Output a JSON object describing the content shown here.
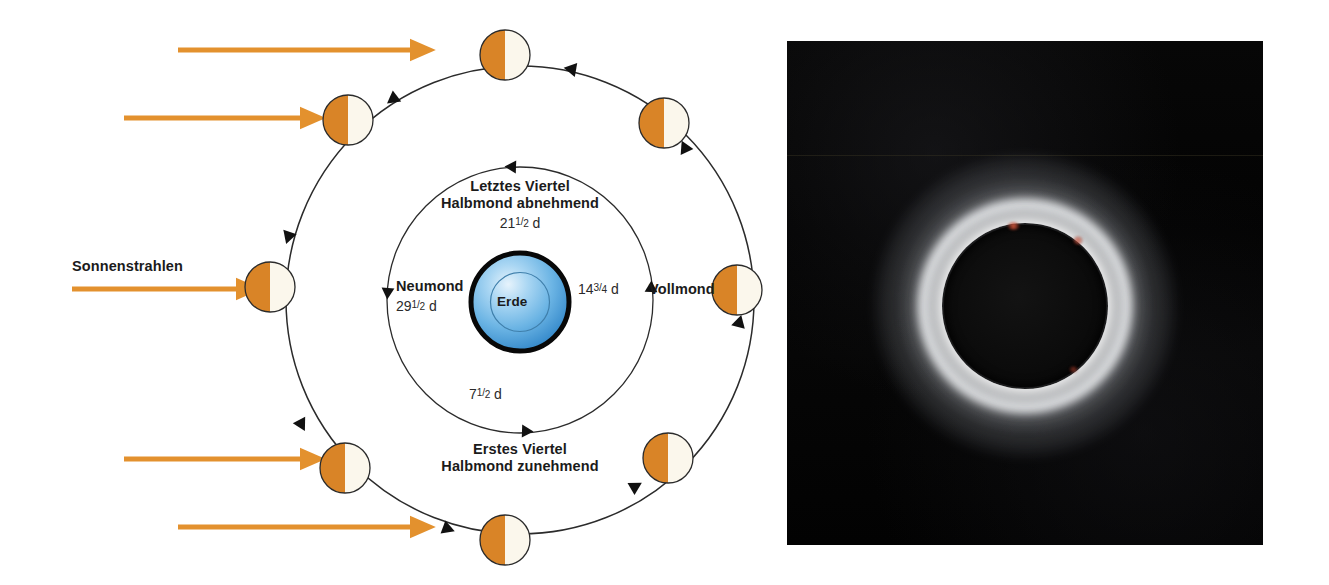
{
  "figure": {
    "colors": {
      "sun_ray": "#E3912E",
      "moon_lit": "#D98427",
      "moon_dark": "#FBF7EC",
      "moon_outline": "#2b2b2b",
      "orbit_line": "#2b2b2b",
      "earth_blue_light": "#CDE6F8",
      "earth_blue_mid": "#4FA3DD",
      "earth_blue_dark": "#2E82C4",
      "earth_outline": "#0a0a0a",
      "text": "#1b1b1b",
      "photo_background": "#040404",
      "corona_white": "#FFFFFF",
      "prominence_red": "#DE5C40"
    }
  },
  "sun_rays": {
    "label": "Sonnenstrahlen",
    "arrows": [
      {
        "id": "ray-1",
        "x1": 178,
        "x2": 432,
        "y": 50
      },
      {
        "id": "ray-2",
        "x1": 124,
        "x2": 322,
        "y": 118
      },
      {
        "id": "ray-3",
        "x1": 72,
        "x2": 258,
        "y": 289
      },
      {
        "id": "ray-4",
        "x1": 124,
        "x2": 322,
        "y": 459
      },
      {
        "id": "ray-5",
        "x1": 178,
        "x2": 432,
        "y": 527
      }
    ]
  },
  "orbit": {
    "center_x": 520,
    "center_y": 300,
    "outer_radius": 234,
    "inner_radius": 133,
    "moon_radius": 25,
    "moons": [
      {
        "id": "moon-top",
        "phase": "waning-gibbous-pos",
        "cx": 505,
        "cy": 55
      },
      {
        "id": "moon-upper-right",
        "phase": "last-quarter-pos",
        "cx": 664,
        "cy": 123
      },
      {
        "id": "moon-right",
        "phase": "full-moon-pos",
        "cx": 737,
        "cy": 290
      },
      {
        "id": "moon-lower-right",
        "phase": "waxing-gibbous-pos",
        "cx": 668,
        "cy": 458
      },
      {
        "id": "moon-bottom",
        "phase": "first-quarter-pos",
        "cx": 505,
        "cy": 540
      },
      {
        "id": "moon-lower-left",
        "phase": "waxing-crescent-pos",
        "cx": 345,
        "cy": 468
      },
      {
        "id": "moon-left",
        "phase": "new-moon-pos",
        "cx": 270,
        "cy": 287
      },
      {
        "id": "moon-upper-left",
        "phase": "waning-crescent-pos",
        "cx": 348,
        "cy": 120
      }
    ]
  },
  "earth": {
    "label": "Erde",
    "cx": 520,
    "cy": 302,
    "radius": 52,
    "inner_radius": 31
  },
  "phase_labels": {
    "last_quarter": {
      "line1": "Letztes Viertel",
      "line2": "Halbmond abnehmend",
      "days_whole": "21",
      "days_num": "1",
      "days_den": "2",
      "days_unit": "d"
    },
    "new_moon": {
      "name": "Neumond",
      "days_whole": "29",
      "days_num": "1",
      "days_den": "2",
      "days_unit": "d"
    },
    "full_moon": {
      "name": "Vollmond",
      "days_whole": "14",
      "days_num": "3",
      "days_den": "4",
      "days_unit": "d"
    },
    "first_quarter": {
      "line1": "Erstes Viertel",
      "line2": "Halbmond zunehmend",
      "days_whole": "7",
      "days_num": "1",
      "days_den": "2",
      "days_unit": "d"
    }
  },
  "eclipse_photo": {
    "alt": "Totale Sonnenfinsternis mit Korona",
    "x": 787,
    "y": 41,
    "width": 476,
    "height": 504
  }
}
